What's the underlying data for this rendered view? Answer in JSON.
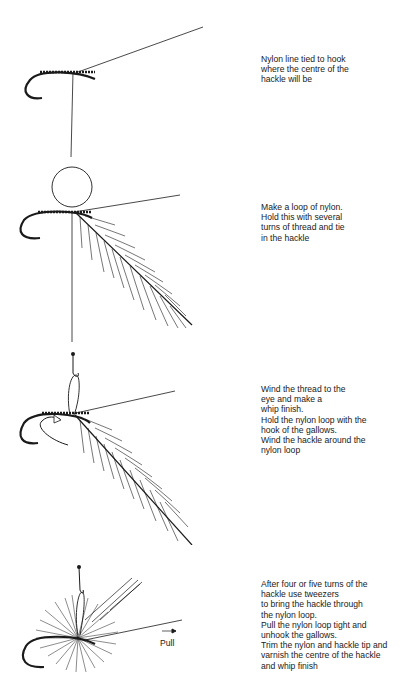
{
  "steps": [
    {
      "id": 1,
      "text": "Nylon line tied to hook\nwhere the centre of the\nhackle will be"
    },
    {
      "id": 2,
      "text": "Make a loop of nylon.\nHold this with several\nturns of thread and tie\nin the hackle"
    },
    {
      "id": 3,
      "text": "Wind the thread to the\neye and make a\nwhip finish.\nHold the nylon loop with the\nhook of the gallows.\nWind the hackle around the\nnylon loop"
    },
    {
      "id": 4,
      "text": "After four or five turns of the\nhackle use tweezers\nto bring the hackle through\nthe nylon loop.\nPull the nylon loop tight and\nunhook the gallows.\nTrim the nylon and hackle tip and\nvarnish the centre of the hackle\nand whip finish",
      "annotation": "Pull"
    }
  ],
  "colors": {
    "ink": "#1a1a1a",
    "background": "#ffffff"
  }
}
